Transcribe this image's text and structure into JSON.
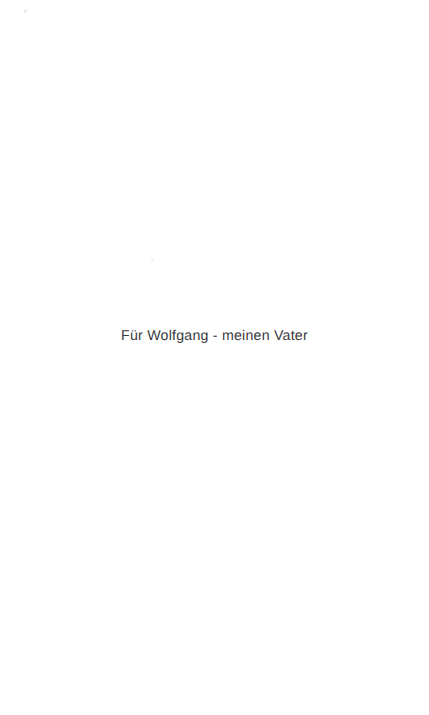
{
  "document": {
    "page_type": "dedication",
    "language": "de",
    "background_color": "#ffffff",
    "width_px": 429,
    "height_px": 715
  },
  "dedication": {
    "text": "Für Wolfgang - meinen Vater",
    "color": "#3a3a3c",
    "alignment": "center"
  },
  "artifacts": {
    "speck_top_left": "",
    "speck_center_left": "",
    "speck_center_right": ""
  }
}
